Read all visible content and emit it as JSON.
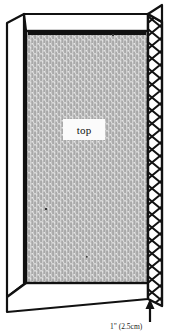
{
  "figure": {
    "kind": "perspective-line-drawing",
    "labels": {
      "top_surface": "top",
      "dimension_callout": "1\" (2.5cm)"
    },
    "annotations": {
      "arrow": "up-arrow pointing to mesh strip",
      "arrow_target": "mesh-screen-strip"
    },
    "colors": {
      "ink": "#111111",
      "paper": "#ffffff",
      "stipple_fill": "#a9a9a9",
      "stipple_speckle": "#f2f2f2",
      "flap_fill": "#ffffff",
      "label_chip": "#fbfbfb"
    },
    "parts": [
      {
        "id": "left-flap",
        "label": "left flap"
      },
      {
        "id": "top-flap",
        "label": "top flap"
      },
      {
        "id": "bottom-flap",
        "label": "bottom flap"
      },
      {
        "id": "top-surface",
        "label": "top"
      },
      {
        "id": "mesh-strip",
        "label": "mesh screen strip"
      }
    ]
  }
}
